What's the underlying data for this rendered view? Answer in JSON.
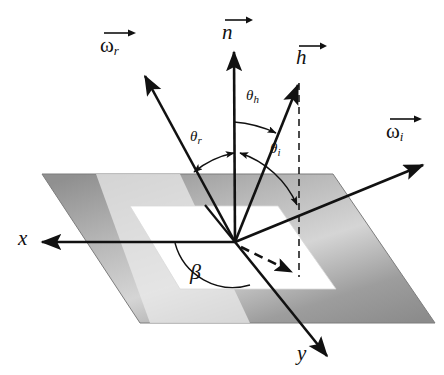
{
  "figure": {
    "type": "vector-geometry-diagram",
    "background_color": "#ffffff",
    "line_color": "#111111",
    "plane": {
      "name": "ground-plane",
      "outer_corners": [
        [
          42,
          174
        ],
        [
          333,
          174
        ],
        [
          435,
          323
        ],
        [
          140,
          323
        ]
      ],
      "inner_corners": [
        [
          130,
          206
        ],
        [
          278,
          206
        ],
        [
          336,
          289
        ],
        [
          180,
          289
        ]
      ],
      "fill_dark": "#8c8c8c",
      "fill_light": "#d8d8d8",
      "inner_fill": "#ffffff"
    },
    "origin": [
      235,
      242
    ],
    "vectors": [
      {
        "id": "n",
        "label": "n",
        "kind": "latin",
        "subscript": "",
        "overbar": true,
        "label_pos": [
          224,
          16
        ],
        "tip": [
          234,
          50
        ],
        "tail": [
          235,
          242
        ],
        "style": "solid"
      },
      {
        "id": "omega_r",
        "label": "ω",
        "kind": "greek",
        "subscript": "r",
        "overbar": true,
        "label_pos": [
          101,
          30
        ],
        "tip": [
          143,
          73
        ],
        "tail": [
          235,
          242
        ],
        "style": "solid"
      },
      {
        "id": "h",
        "label": "h",
        "kind": "latin",
        "subscript": "",
        "overbar": true,
        "label_pos": [
          298,
          43
        ],
        "tip": [
          297,
          82
        ],
        "tail": [
          235,
          242
        ],
        "style": "solid"
      },
      {
        "id": "omega_i",
        "label": "ω",
        "kind": "greek",
        "subscript": "i",
        "overbar": true,
        "label_pos": [
          388,
          117
        ],
        "tip": [
          425,
          163
        ],
        "tail": [
          235,
          242
        ],
        "style": "solid"
      },
      {
        "id": "x_axis",
        "label": "x",
        "kind": "latin",
        "subscript": "",
        "overbar": false,
        "label_pos": [
          20,
          228
        ],
        "tip": [
          39,
          242
        ],
        "tail": [
          235,
          242
        ],
        "style": "solid"
      },
      {
        "id": "y_axis",
        "label": "y",
        "kind": "latin",
        "subscript": "",
        "overbar": false,
        "label_pos": [
          298,
          344
        ],
        "tip": [
          330,
          358
        ],
        "tail": [
          235,
          242
        ],
        "style": "solid"
      },
      {
        "id": "h_projection",
        "label": "",
        "kind": "none",
        "subscript": "",
        "overbar": false,
        "label_pos": [
          0,
          0
        ],
        "tip": [
          298,
          275
        ],
        "tail": [
          235,
          242
        ],
        "style": "dashed"
      }
    ],
    "dashed_lines": [
      {
        "id": "h-vertical-dashed",
        "from": [
          299,
          83
        ],
        "to": [
          299,
          277
        ]
      }
    ],
    "angles": [
      {
        "id": "theta_h",
        "label": "θ",
        "subscript": "h",
        "label_pos": [
          246,
          92
        ],
        "between": [
          "n",
          "h"
        ]
      },
      {
        "id": "theta_r",
        "label": "θ",
        "subscript": "r",
        "label_pos": [
          190,
          130
        ],
        "between": [
          "n",
          "omega_r"
        ]
      },
      {
        "id": "theta_i",
        "label": "θ",
        "subscript": "i",
        "label_pos": [
          270,
          143
        ],
        "between": [
          "n",
          "omega_i"
        ]
      },
      {
        "id": "beta",
        "label": "β",
        "subscript": "",
        "label_pos": [
          191,
          263
        ],
        "between": [
          "x_axis",
          "h_projection"
        ]
      }
    ]
  }
}
